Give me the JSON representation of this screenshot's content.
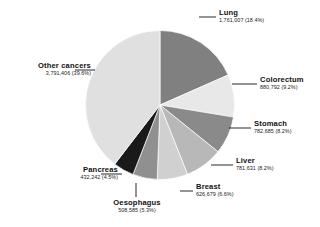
{
  "chart_data": {
    "type": "pie",
    "title": "",
    "subtitle": "",
    "xlabel": "",
    "ylabel": "",
    "legend_position": "callout-labels",
    "grid": false,
    "start_angle_deg": 0,
    "direction": "clockwise",
    "categories": [
      "Lung",
      "Colorectum",
      "Stomach",
      "Liver",
      "Breast",
      "Oesophagus",
      "Pancreas",
      "Other cancers"
    ],
    "values": [
      1761007,
      880792,
      782685,
      781631,
      626679,
      508585,
      432242,
      3791406
    ],
    "percentages": [
      18.4,
      9.2,
      8.2,
      8.2,
      6.6,
      5.3,
      4.5,
      39.6
    ],
    "value_labels": [
      "1,761,007",
      "880,792",
      "782,685",
      "781,631",
      "626,679",
      "508,585",
      "432,242",
      "3,791,406"
    ],
    "percent_labels": [
      "(18.4%)",
      "(9.2%)",
      "(8.2%)",
      "(8.2%)",
      "(6.6%)",
      "(5.3%)",
      "(4.5%)",
      "(39.6%)"
    ],
    "colors": [
      "#808080",
      "#e8e8e8",
      "#8a8a8a",
      "#b8b8b8",
      "#d0d0d0",
      "#909090",
      "#1a1a1a",
      "#e0e0e0"
    ],
    "slices": [
      {
        "name": "Lung",
        "value": 1761007,
        "percent": 18.4,
        "value_label": "1,761,007",
        "percent_label": "(18.4%)",
        "caption": "1,761,007 (18.4%)",
        "color": "#808080"
      },
      {
        "name": "Colorectum",
        "value": 880792,
        "percent": 9.2,
        "value_label": "880,792",
        "percent_label": "(9.2%)",
        "caption": "880,792 (9.2%)",
        "color": "#e8e8e8"
      },
      {
        "name": "Stomach",
        "value": 782685,
        "percent": 8.2,
        "value_label": "782,685",
        "percent_label": "(8.2%)",
        "caption": "782,685 (8.2%)",
        "color": "#8a8a8a"
      },
      {
        "name": "Liver",
        "value": 781631,
        "percent": 8.2,
        "value_label": "781,631",
        "percent_label": "(8.2%)",
        "caption": "781,631 (8.2%)",
        "color": "#b8b8b8"
      },
      {
        "name": "Breast",
        "value": 626679,
        "percent": 6.6,
        "value_label": "626,679",
        "percent_label": "(6.6%)",
        "caption": "626,679 (6.6%)",
        "color": "#d0d0d0"
      },
      {
        "name": "Oesophagus",
        "value": 508585,
        "percent": 5.3,
        "value_label": "508,585",
        "percent_label": "(5.3%)",
        "caption": "508,585 (5.3%)",
        "color": "#909090"
      },
      {
        "name": "Pancreas",
        "value": 432242,
        "percent": 4.5,
        "value_label": "432,242",
        "percent_label": "(4.5%)",
        "caption": "432,242 (4.5%)",
        "color": "#1a1a1a"
      },
      {
        "name": "Other cancers",
        "value": 3791406,
        "percent": 39.6,
        "value_label": "3,791,406",
        "percent_label": "(39.6%)",
        "caption": "3,791,406 (39.6%)",
        "color": "#e0e0e0"
      }
    ]
  }
}
